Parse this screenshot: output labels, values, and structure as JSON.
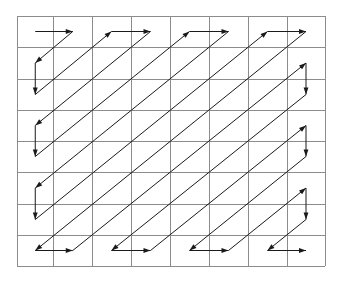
{
  "diagram": {
    "grid": {
      "rows": 8,
      "cols": 8,
      "x_lines": [
        17,
        53.5,
        92,
        131,
        170,
        209,
        248,
        287,
        325
      ],
      "y_lines": [
        16,
        47,
        79,
        110,
        141,
        172,
        204,
        235,
        266
      ],
      "line_color": "#8c8c8c"
    },
    "path": {
      "type": "zigzag",
      "start_cell": [
        0,
        0
      ],
      "end_cell": [
        7,
        7
      ],
      "stroke_color": "#1a1a1a",
      "arrowheads": "at end of each straight run"
    }
  }
}
